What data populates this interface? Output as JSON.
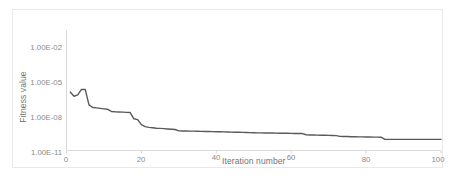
{
  "chart_data": {
    "type": "line",
    "title": "",
    "xlabel": "Iteration number",
    "ylabel": "Fitness value",
    "yscale": "log",
    "xlim": [
      0,
      100
    ],
    "ylim": [
      1e-11,
      0.01
    ],
    "grid": false,
    "legend": null,
    "line_color": "#595959",
    "x_ticks": [
      "0",
      "20",
      "40",
      "60",
      "80",
      "100"
    ],
    "x_tick_values": [
      0,
      20,
      40,
      60,
      80,
      100
    ],
    "y_ticks": [
      "1.00E-02",
      "1.00E-05",
      "1.00E-08",
      "1.00E-11"
    ],
    "y_tick_values": [
      0.01,
      1e-05,
      1e-08,
      1e-11
    ],
    "series": [
      {
        "name": "fitness",
        "x": [
          1,
          2,
          3,
          4,
          5,
          6,
          7,
          8,
          9,
          10,
          11,
          12,
          13,
          14,
          15,
          16,
          17,
          18,
          19,
          20,
          21,
          22,
          23,
          24,
          25,
          26,
          27,
          28,
          29,
          30,
          31,
          32,
          33,
          34,
          35,
          36,
          37,
          38,
          39,
          40,
          41,
          42,
          43,
          44,
          45,
          46,
          47,
          48,
          49,
          50,
          51,
          52,
          53,
          54,
          55,
          56,
          57,
          58,
          59,
          60,
          61,
          62,
          63,
          64,
          65,
          66,
          67,
          68,
          69,
          70,
          71,
          72,
          73,
          74,
          75,
          76,
          77,
          78,
          79,
          80,
          81,
          82,
          83,
          84,
          85,
          86,
          87,
          88,
          89,
          90,
          91,
          92,
          93,
          94,
          95,
          96,
          97,
          98,
          99,
          100
        ],
        "y": [
          1.4e-06,
          6e-07,
          8e-07,
          2.3e-06,
          2.3e-06,
          1.1e-07,
          6.5e-08,
          6e-08,
          5.5e-08,
          5e-08,
          4.6e-08,
          3e-08,
          2.8e-08,
          2.7e-08,
          2.6e-08,
          2.5e-08,
          2.4e-08,
          7e-09,
          6e-09,
          2.2e-09,
          1.5e-09,
          1.3e-09,
          1.2e-09,
          1.1e-09,
          1.05e-09,
          1e-09,
          9.5e-10,
          9e-10,
          8.5e-10,
          6.5e-10,
          6.4e-10,
          6.3e-10,
          6.2e-10,
          6.1e-10,
          6e-10,
          5.9e-10,
          5.8e-10,
          5.7e-10,
          5.6e-10,
          5.5e-10,
          5.4e-10,
          5.3e-10,
          5.2e-10,
          5.1e-10,
          5e-10,
          4.9e-10,
          4.8e-10,
          4.7e-10,
          4.6e-10,
          4.5e-10,
          4.4e-10,
          4.35e-10,
          4.3e-10,
          4.25e-10,
          4.2e-10,
          4.15e-10,
          4.1e-10,
          4.05e-10,
          4e-10,
          3.95e-10,
          3.9e-10,
          3.85e-10,
          3.8e-10,
          3e-10,
          2.9e-10,
          2.85e-10,
          2.8e-10,
          2.75e-10,
          2.7e-10,
          2.65e-10,
          2.6e-10,
          2.55e-10,
          2.2e-10,
          2.15e-10,
          2.1e-10,
          2.05e-10,
          2e-10,
          1.98e-10,
          1.96e-10,
          1.94e-10,
          1.92e-10,
          1.9e-10,
          1.88e-10,
          1.86e-10,
          1.2e-10,
          1.2e-10,
          1.2e-10,
          1.2e-10,
          1.2e-10,
          1.2e-10,
          1.2e-10,
          1.2e-10,
          1.2e-10,
          1.2e-10,
          1.2e-10,
          1.2e-10,
          1.2e-10,
          1.2e-10,
          1.2e-10,
          1.2e-10
        ]
      }
    ]
  }
}
